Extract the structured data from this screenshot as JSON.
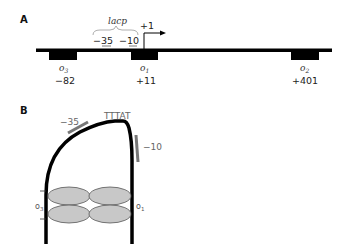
{
  "panel_a": {
    "label": "A",
    "promoter": {
      "name": "lacp",
      "elements": [
        {
          "label": "−35"
        },
        {
          "label": "−10"
        }
      ]
    },
    "transcription_start": {
      "label": "+1"
    },
    "operators": [
      {
        "name": "o",
        "subscript": "3",
        "position": "−82"
      },
      {
        "name": "o",
        "subscript": "1",
        "position": "+11"
      },
      {
        "name": "o",
        "subscript": "2",
        "position": "+401"
      }
    ]
  },
  "panel_b": {
    "label": "B",
    "top_sequence": "TTTAT",
    "element_minus35": "−35",
    "element_minus10": "−10",
    "operator_left": {
      "name": "o",
      "subscript": "3"
    },
    "operator_right": {
      "name": "o",
      "subscript": "1"
    }
  },
  "colors": {
    "dna": "#000000",
    "promoter_marks": "#777777",
    "repressor_fill": "#c8c8c8",
    "repressor_stroke": "#555555"
  }
}
